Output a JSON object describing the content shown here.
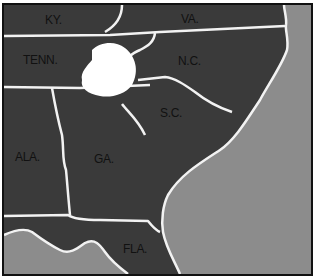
{
  "map": {
    "colors": {
      "land": "#3a3a3a",
      "ocean": "#8a8a8a",
      "border": "#f2f2f2",
      "highlight": "#ffffff",
      "frame": "#111111"
    },
    "states": [
      {
        "label": "KY."
      },
      {
        "label": "VA."
      },
      {
        "label": "TENN."
      },
      {
        "label": "N.C."
      },
      {
        "label": "S.C."
      },
      {
        "label": "ALA."
      },
      {
        "label": "GA."
      },
      {
        "label": "FLA."
      }
    ],
    "highlighted_region": "white area at TN/NC/GA border"
  }
}
